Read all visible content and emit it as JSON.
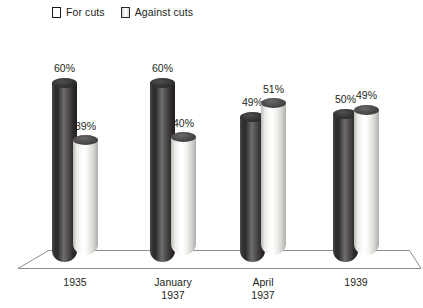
{
  "chart_data": {
    "type": "bar",
    "title": "",
    "subtitle": "",
    "xlabel": "",
    "ylabel": "",
    "ylim": [
      0,
      100
    ],
    "grid": false,
    "legend_position": "top-left",
    "categories": [
      "1935",
      "January\n1937",
      "April\n1937",
      "1939"
    ],
    "series": [
      {
        "name": "For cuts",
        "color": "#2f2c2d",
        "values": [
          60,
          60,
          49,
          50
        ],
        "value_labels": [
          "60%",
          "60%",
          "49%",
          "50%"
        ]
      },
      {
        "name": "Against cuts",
        "color": "#f2f2ef",
        "values": [
          39,
          40,
          51,
          49
        ],
        "value_labels": [
          "39%",
          "40%",
          "51%",
          "49%"
        ]
      }
    ],
    "annotations": []
  },
  "legend": {
    "items": [
      {
        "label": "For cuts",
        "swatch": "dark-cylinder-swatch"
      },
      {
        "label": "Against cuts",
        "swatch": "light-cylinder-swatch"
      }
    ]
  },
  "axis": {
    "ticks": [
      {
        "lines": [
          "1935"
        ]
      },
      {
        "lines": [
          "January",
          "1937"
        ]
      },
      {
        "lines": [
          "April",
          "1937"
        ]
      },
      {
        "lines": [
          "1939"
        ]
      }
    ]
  },
  "style": {
    "background": "#ffffff",
    "text_color": "#231f20",
    "floor_line_color": "#8d8d8a"
  }
}
